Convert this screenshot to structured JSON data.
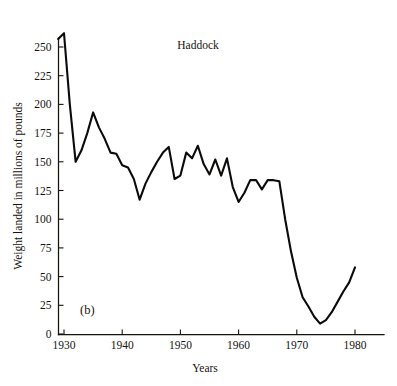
{
  "figure": {
    "panel_label": "(b)",
    "title": "Haddock",
    "x_axis_title": "Years",
    "y_axis_title": "Weight landed in millions of pounds",
    "line_color": "#0d0b09",
    "background_color": "#ffffff"
  },
  "chart_data": {
    "type": "line",
    "title": "Haddock",
    "subtitle": "",
    "xlabel": "Years",
    "ylabel": "Weight landed in millions of pounds",
    "xlim": [
      1928,
      1983
    ],
    "ylim": [
      0,
      262
    ],
    "grid": false,
    "legend": false,
    "legend_position": "none",
    "xticks": [
      1930,
      1940,
      1950,
      1960,
      1970,
      1980
    ],
    "xtick_labels": [
      "1930",
      "1940",
      "1950",
      "1960",
      "1970",
      "1980"
    ],
    "yticks": [
      0,
      25,
      50,
      75,
      100,
      125,
      150,
      175,
      200,
      225,
      250
    ],
    "ytick_labels": [
      "0",
      "25",
      "50",
      "75",
      "100",
      "125",
      "150",
      "175",
      "200",
      "225",
      "250"
    ],
    "annotations": [
      {
        "text": "(b)",
        "x": 1932,
        "y": 18
      },
      {
        "text": "Haddock",
        "x": 1953,
        "y": 253
      }
    ],
    "series": [
      {
        "name": "Haddock landings",
        "x": [
          1929,
          1930,
          1931,
          1932,
          1933,
          1934,
          1935,
          1936,
          1937,
          1938,
          1939,
          1940,
          1941,
          1942,
          1943,
          1944,
          1945,
          1946,
          1947,
          1948,
          1949,
          1950,
          1951,
          1952,
          1953,
          1954,
          1955,
          1956,
          1957,
          1958,
          1959,
          1960,
          1961,
          1962,
          1963,
          1964,
          1965,
          1966,
          1967,
          1968,
          1969,
          1970,
          1971,
          1972,
          1973,
          1974,
          1975,
          1976,
          1977,
          1978,
          1979,
          1980
        ],
        "y": [
          257,
          262,
          200,
          150,
          160,
          175,
          193,
          180,
          170,
          158,
          157,
          147,
          145,
          135,
          117,
          131,
          141,
          150,
          158,
          163,
          135,
          138,
          158,
          153,
          164,
          148,
          139,
          152,
          138,
          153,
          128,
          115,
          123,
          134,
          134,
          126,
          134,
          134,
          133,
          100,
          72,
          49,
          32,
          24,
          15,
          9,
          12,
          19,
          28,
          37,
          45,
          58
        ]
      }
    ]
  }
}
